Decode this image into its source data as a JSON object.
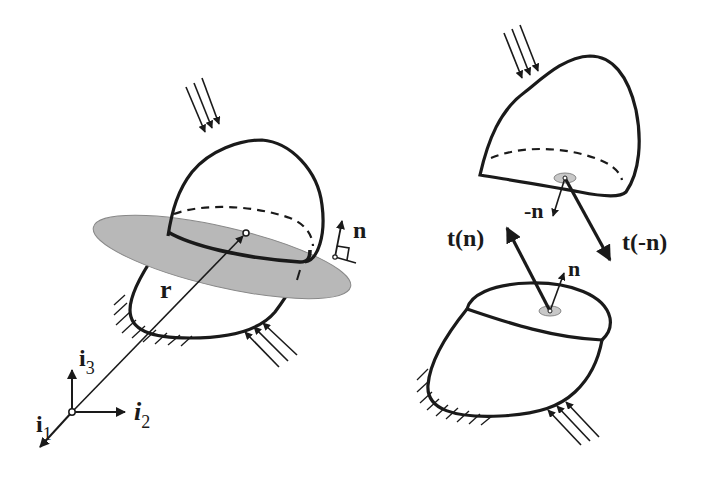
{
  "figure": {
    "left_panel": {
      "description": "Deformable body cut by a plane with position vector r and normal n",
      "labels": {
        "position_vector": "r",
        "normal": "n"
      },
      "axes": {
        "i1": {
          "base": "i",
          "sub": "1"
        },
        "i2": {
          "base": "i",
          "sub": "2"
        },
        "i3": {
          "base": "i",
          "sub": "3"
        }
      }
    },
    "right_panel": {
      "description": "Body separated into two parts showing traction vectors",
      "labels": {
        "neg_normal": "-n",
        "normal": "n",
        "traction_n": "t(n)",
        "traction_neg_n": "t(-n)"
      }
    },
    "colors": {
      "stroke": "#1a1a1a",
      "plane_fill": "#b8b8b8",
      "patch_fill": "#c8c8c8",
      "background": "#ffffff"
    }
  }
}
